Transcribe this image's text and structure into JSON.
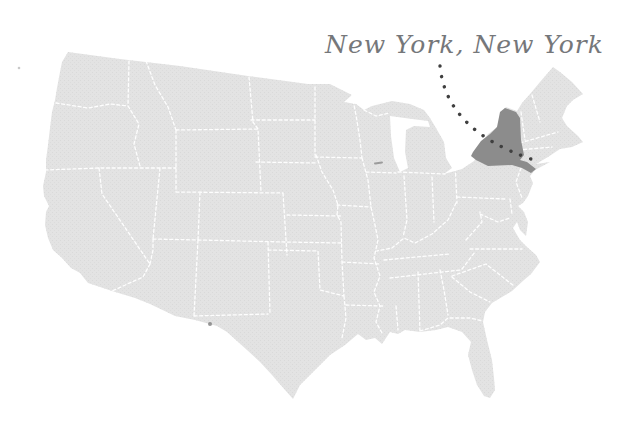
{
  "map": {
    "label": "New York, New York",
    "highlighted_state": "New York",
    "country": "United States (lower 48 states)",
    "colors": {
      "background": "#ffffff",
      "land_fill": "#e3e3e3",
      "land_texture_dot": "#d0d0d0",
      "state_border": "#ffffff",
      "highlight_fill": "#8c8c8c",
      "leader_dots": "#3f3f3f",
      "label_text": "#75777a"
    },
    "annotation": {
      "style": "handwritten script label with dotted leader line",
      "leader_line_target": "New York City area of New York state"
    }
  }
}
